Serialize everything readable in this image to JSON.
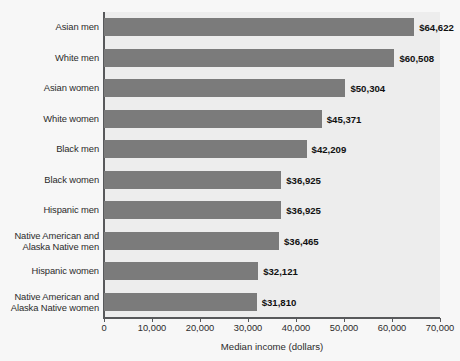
{
  "chart_data": {
    "type": "bar",
    "orientation": "horizontal",
    "title": "",
    "xlabel": "Median income (dollars)",
    "ylabel": "",
    "xlim": [
      0,
      70000
    ],
    "xticks": [
      0,
      10000,
      20000,
      30000,
      40000,
      50000,
      60000,
      70000
    ],
    "xtick_labels": [
      "0",
      "10,000",
      "20,000",
      "30,000",
      "40,000",
      "50,000",
      "60,000",
      "70,000"
    ],
    "grid": false,
    "legend": false,
    "bar_color": "#7b7b7b",
    "plot_background": "#ededed",
    "categories": [
      "Asian men",
      "White men",
      "Asian women",
      "White women",
      "Black men",
      "Black women",
      "Hispanic men",
      "Native American and Alaska Native men",
      "Hispanic women",
      "Native American and Alaska Native women"
    ],
    "category_lines": [
      [
        "Asian men"
      ],
      [
        "White men"
      ],
      [
        "Asian women"
      ],
      [
        "White women"
      ],
      [
        "Black men"
      ],
      [
        "Black women"
      ],
      [
        "Hispanic men"
      ],
      [
        "Native American and",
        "Alaska Native men"
      ],
      [
        "Hispanic women"
      ],
      [
        "Native American and",
        "Alaska Native women"
      ]
    ],
    "values": [
      64622,
      60508,
      50304,
      45371,
      42209,
      36925,
      36925,
      36465,
      32121,
      31810
    ],
    "value_labels": [
      "$64,622",
      "$60,508",
      "$50,304",
      "$45,371",
      "$42,209",
      "$36,925",
      "$36,925",
      "$36,465",
      "$32,121",
      "$31,810"
    ]
  }
}
